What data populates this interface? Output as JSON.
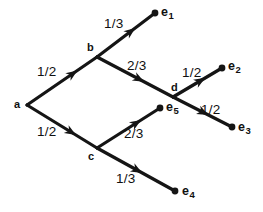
{
  "diagram": {
    "type": "probability-tree",
    "width": 263,
    "height": 212,
    "background_color": "#ffffff",
    "ink_color": "#151515",
    "nodes": [
      {
        "id": "a",
        "label": "a",
        "x": 27,
        "y": 105,
        "kind": "branch",
        "label_x": 14,
        "label_y": 99
      },
      {
        "id": "b",
        "label": "b",
        "x": 97,
        "y": 57,
        "kind": "branch",
        "label_x": 87,
        "label_y": 42
      },
      {
        "id": "c",
        "label": "c",
        "x": 97,
        "y": 148,
        "kind": "branch",
        "label_x": 88,
        "label_y": 151
      },
      {
        "id": "d",
        "label": "d",
        "x": 173,
        "y": 97,
        "kind": "branch",
        "label_x": 171,
        "label_y": 82
      },
      {
        "id": "e1",
        "label": "e",
        "sub": "1",
        "x": 155,
        "y": 13,
        "kind": "terminal",
        "label_x": 161,
        "label_y": 6
      },
      {
        "id": "e2",
        "label": "e",
        "sub": "2",
        "x": 222,
        "y": 68,
        "kind": "terminal",
        "label_x": 228,
        "label_y": 60
      },
      {
        "id": "e3",
        "label": "e",
        "sub": "3",
        "x": 232,
        "y": 127,
        "kind": "terminal",
        "label_x": 238,
        "label_y": 121
      },
      {
        "id": "e4",
        "label": "e",
        "sub": "4",
        "x": 175,
        "y": 191,
        "kind": "terminal",
        "label_x": 182,
        "label_y": 185
      },
      {
        "id": "e5",
        "label": "e",
        "sub": "5",
        "x": 160,
        "y": 108,
        "kind": "terminal",
        "label_x": 166,
        "label_y": 101
      }
    ],
    "edges": [
      {
        "id": "a-b",
        "from": "a",
        "to": "b",
        "weight": "1/2",
        "label_x": 37,
        "label_y": 65,
        "arrow_t": 0.72
      },
      {
        "id": "a-c",
        "from": "a",
        "to": "c",
        "weight": "1/2",
        "label_x": 37,
        "label_y": 125,
        "arrow_t": 0.7
      },
      {
        "id": "b-e1",
        "from": "b",
        "to": "e1",
        "weight": "1/3",
        "label_x": 104,
        "label_y": 17,
        "arrow_t": 0.66
      },
      {
        "id": "b-d",
        "from": "b",
        "to": "d",
        "weight": "2/3",
        "label_x": 127,
        "label_y": 59,
        "arrow_t": 0.62
      },
      {
        "id": "d-e2",
        "from": "d",
        "to": "e2",
        "weight": "1/2",
        "label_x": 182,
        "label_y": 66,
        "arrow_t": 0.66
      },
      {
        "id": "d-e3",
        "from": "d",
        "to": "e3",
        "weight": "1/2",
        "label_x": 201,
        "label_y": 103,
        "arrow_t": 0.6
      },
      {
        "id": "c-e5",
        "from": "c",
        "to": "e5",
        "weight": "2/3",
        "label_x": 124,
        "label_y": 127,
        "arrow_t": 0.7
      },
      {
        "id": "c-e4",
        "from": "c",
        "to": "e4",
        "weight": "1/3",
        "label_x": 116,
        "label_y": 172,
        "arrow_t": 0.58
      }
    ]
  }
}
